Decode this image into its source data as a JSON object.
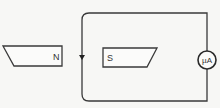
{
  "diagram": {
    "type": "electromagnetic induction setup",
    "magnet_left": {
      "pole_label": "N"
    },
    "magnet_right": {
      "pole_label": "S"
    },
    "meter": {
      "label": "µA"
    },
    "current_arrow": {
      "direction": "down",
      "position": "left wire of loop"
    },
    "colors": {
      "line": "#3a3a3a",
      "background": "#f7f7f5"
    }
  }
}
